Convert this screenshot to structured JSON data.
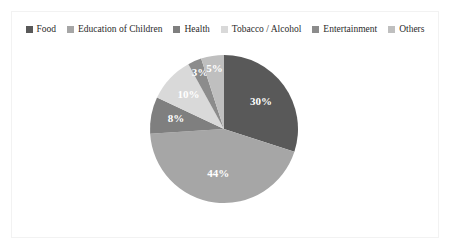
{
  "chart_data": {
    "type": "pie",
    "title": "",
    "subtitle": "",
    "xlabel": "",
    "ylabel": "",
    "legend_position": "top",
    "grid": false,
    "units": "percent",
    "categories": [
      "Food",
      "Education of Children",
      "Health",
      "Tobacco / Alcohol",
      "Entertainment",
      "Others"
    ],
    "values": [
      30,
      44,
      8,
      10,
      3,
      5
    ],
    "data_labels": [
      "30%",
      "44%",
      "8%",
      "10%",
      "3%",
      "5%"
    ],
    "colors": [
      "#595959",
      "#a6a6a6",
      "#7f7f7f",
      "#d9d9d9",
      "#8c8c8c",
      "#bfbfbf"
    ],
    "slices": [
      {
        "label": "Food",
        "value": 30,
        "display": "30%",
        "color": "#595959"
      },
      {
        "label": "Education of Children",
        "value": 44,
        "display": "44%",
        "color": "#a6a6a6"
      },
      {
        "label": "Health",
        "value": 8,
        "display": "8%",
        "color": "#7f7f7f"
      },
      {
        "label": "Tobacco / Alcohol",
        "value": 10,
        "display": "10%",
        "color": "#d9d9d9"
      },
      {
        "label": "Entertainment",
        "value": 3,
        "display": "3%",
        "color": "#8c8c8c"
      },
      {
        "label": "Others",
        "value": 5,
        "display": "5%",
        "color": "#bfbfbf"
      }
    ]
  },
  "legend": {
    "items": [
      {
        "label": "Food",
        "color": "#595959"
      },
      {
        "label": "Education of Children",
        "color": "#a6a6a6"
      },
      {
        "label": "Health",
        "color": "#7f7f7f"
      },
      {
        "label": "Tobacco / Alcohol",
        "color": "#d9d9d9"
      },
      {
        "label": "Entertainment",
        "color": "#8c8c8c"
      },
      {
        "label": "Others",
        "color": "#bfbfbf"
      }
    ]
  },
  "frame": {
    "border_color": "#f2f2f2",
    "background": "#ffffff"
  }
}
